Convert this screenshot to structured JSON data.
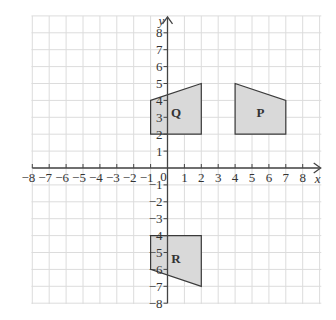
{
  "figure": {
    "x_axis_label": "x",
    "y_axis_label": "y",
    "origin_label": "0",
    "x_range": [
      -8,
      8
    ],
    "y_range": [
      -8,
      8
    ],
    "grid": true,
    "x_tick_labels": [
      "-8",
      "-7",
      "-6",
      "-5",
      "-4",
      "-3",
      "-2",
      "-1",
      "1",
      "2",
      "3",
      "4",
      "5",
      "6",
      "7",
      "8"
    ],
    "y_tick_labels": [
      "8",
      "7",
      "6",
      "5",
      "4",
      "3",
      "2",
      "1",
      "-1",
      "-2",
      "-3",
      "-4",
      "-5",
      "-6",
      "-7",
      "-8"
    ],
    "colors": {
      "grid": "#dcdcdc",
      "axis": "#444444",
      "shape_fill": "#d9d9d9",
      "shape_stroke": "#3a3a3a"
    },
    "shapes": [
      {
        "name": "Q",
        "vertices": [
          [
            -1,
            4
          ],
          [
            2,
            5
          ],
          [
            2,
            2
          ],
          [
            -1,
            2
          ]
        ],
        "label_at": [
          0.5,
          3.3
        ]
      },
      {
        "name": "P",
        "vertices": [
          [
            4,
            5
          ],
          [
            7,
            4
          ],
          [
            7,
            2
          ],
          [
            4,
            2
          ]
        ],
        "label_at": [
          5.5,
          3.3
        ]
      },
      {
        "name": "R",
        "vertices": [
          [
            -1,
            -4
          ],
          [
            2,
            -4
          ],
          [
            2,
            -7
          ],
          [
            -1,
            -6
          ]
        ],
        "label_at": [
          0.5,
          -5.3
        ]
      }
    ]
  }
}
